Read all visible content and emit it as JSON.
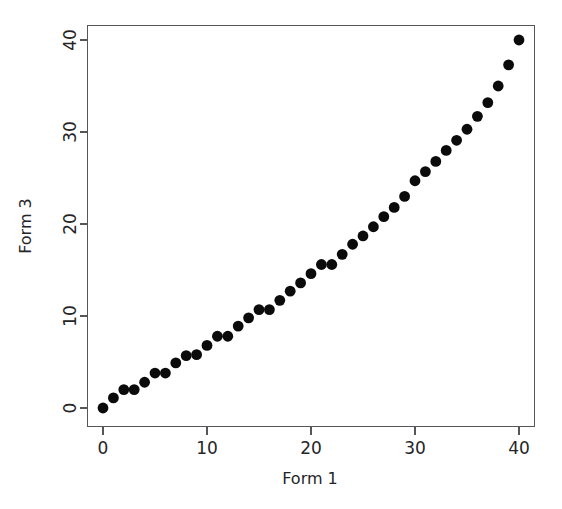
{
  "chart_data": {
    "type": "scatter",
    "title": "",
    "xlabel": "Form 1",
    "ylabel": "Form 3",
    "xlim": [
      -1.5,
      41.5
    ],
    "ylim": [
      -1.5,
      41.5
    ],
    "xticks": [
      0,
      10,
      20,
      30,
      40
    ],
    "yticks": [
      0,
      10,
      20,
      30,
      40
    ],
    "xtick_labels": [
      "0",
      "10",
      "20",
      "30",
      "40"
    ],
    "ytick_labels": [
      "0",
      "10",
      "20",
      "30",
      "40"
    ],
    "grid": false,
    "legend": null,
    "marker": "filled-circle",
    "marker_color": "#0b0b0b",
    "marker_size": 5.4,
    "axis_color": "#55555a",
    "background": "#ffffff",
    "box": true,
    "series": [
      {
        "name": "Form 1 vs Form 3 equating",
        "x": [
          0,
          1,
          2,
          3,
          4,
          5,
          6,
          7,
          8,
          9,
          10,
          11,
          12,
          13,
          14,
          15,
          16,
          17,
          18,
          19,
          20,
          21,
          22,
          23,
          24,
          25,
          26,
          27,
          28,
          29,
          30,
          31,
          32,
          33,
          34,
          35,
          36,
          37,
          38,
          39,
          40
        ],
        "y": [
          0.0,
          1.1,
          2.0,
          2.0,
          2.8,
          3.8,
          3.8,
          4.9,
          5.7,
          5.8,
          6.8,
          7.8,
          7.8,
          8.9,
          9.8,
          10.7,
          10.7,
          11.7,
          12.7,
          13.6,
          14.6,
          15.6,
          15.6,
          16.7,
          17.8,
          18.7,
          19.7,
          20.8,
          21.8,
          23.0,
          24.7,
          25.7,
          26.8,
          28.0,
          29.1,
          30.3,
          31.7,
          33.2,
          35.0,
          37.3,
          40.0
        ]
      }
    ]
  },
  "axes": {
    "x_title": "Form 1",
    "y_title": "Form 3"
  }
}
